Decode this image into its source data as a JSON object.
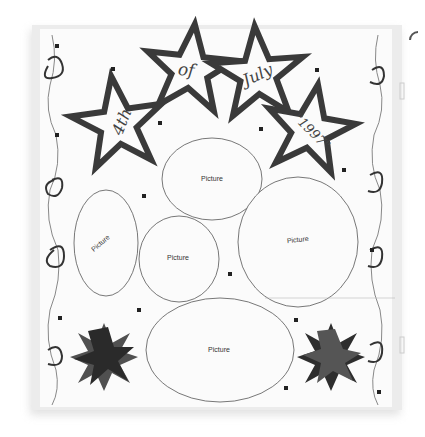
{
  "scene": {
    "description": "Photo of a 4th of July scrapbook layout page with star cutouts, swirl border and oval photo placeholders",
    "stars": [
      {
        "text": "4th"
      },
      {
        "text": "of"
      },
      {
        "text": "July"
      },
      {
        "text": "\"1997\""
      }
    ],
    "ovals": [
      {
        "label": "Picture"
      },
      {
        "label": "Picture"
      },
      {
        "label": "Picture"
      },
      {
        "label": "Picture"
      },
      {
        "label": "Picture"
      }
    ],
    "colors": {
      "paper": "#fbfbfb",
      "star_outline": "#3a3a3a",
      "burst_dark": "#2a2a2a",
      "burst_mid": "#505050",
      "sheet_edge": "#e6e6e6"
    }
  }
}
